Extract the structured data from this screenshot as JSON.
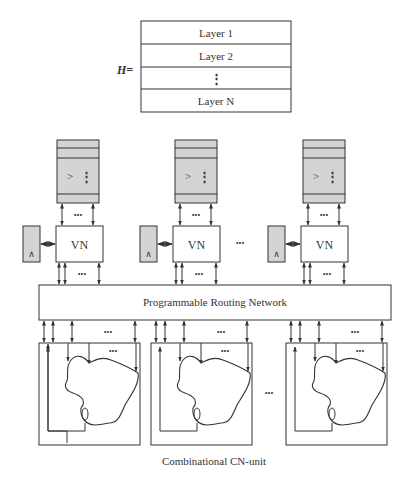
{
  "layer_table": {
    "prefix": "H=",
    "rows": [
      "Layer 1",
      "Layer 2",
      "⋮",
      "Layer N"
    ]
  },
  "columns": [
    {
      "memory_symbol": ">",
      "memory_dots": "⋮",
      "node_label": "VN",
      "side_symbol": "∧"
    },
    {
      "memory_symbol": ">",
      "memory_dots": "⋮",
      "node_label": "VN",
      "side_symbol": "∧"
    },
    {
      "memory_symbol": ">",
      "memory_dots": "⋮",
      "node_label": "VN",
      "side_symbol": "∧"
    }
  ],
  "ellipsis": "•••",
  "routing_network": {
    "label": "Programmable Routing Network"
  },
  "cn_units": {
    "caption": "Combinational CN-unit",
    "count_shown": 3
  },
  "colors": {
    "fill_gray": "#d4d4d4",
    "stroke": "#333333",
    "background": "#ffffff"
  }
}
